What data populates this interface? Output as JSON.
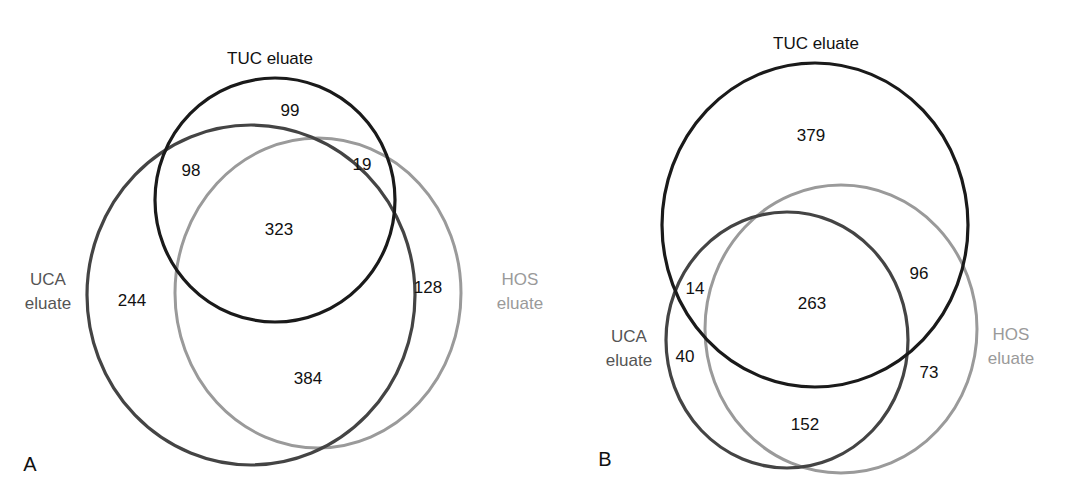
{
  "colors": {
    "tuc": "#1a1a1a",
    "uca": "#444444",
    "hos": "#9a9a9a",
    "tuc_label": "#111111",
    "uca_label": "#555555",
    "hos_label": "#9a9a9a"
  },
  "panels": [
    {
      "panel_label": "A",
      "sets": {
        "tuc": "TUC eluate",
        "uca_line1": "UCA",
        "uca_line2": "eluate",
        "hos_line1": "HOS",
        "hos_line2": "eluate"
      },
      "regions": {
        "tuc_only": "99",
        "tuc_uca": "98",
        "tuc_hos": "19",
        "all_three": "323",
        "uca_only": "244",
        "hos_only": "128",
        "uca_hos": "384"
      }
    },
    {
      "panel_label": "B",
      "sets": {
        "tuc": "TUC eluate",
        "uca_line1": "UCA",
        "uca_line2": "eluate",
        "hos_line1": "HOS",
        "hos_line2": "eluate"
      },
      "regions": {
        "tuc_only": "379",
        "tuc_uca": "14",
        "tuc_hos": "96",
        "all_three": "263",
        "uca_only": "40",
        "hos_only": "73",
        "uca_hos": "152"
      }
    }
  ]
}
